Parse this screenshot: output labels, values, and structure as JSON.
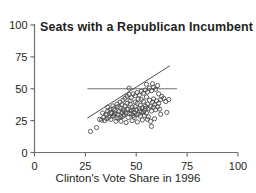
{
  "chart_data": {
    "type": "scatter",
    "title": "Seats with a Republican Incumbent",
    "xlabel": "Clinton's Vote Share in 1996",
    "ylabel": "",
    "xlim": [
      0,
      100
    ],
    "ylim": [
      0,
      100
    ],
    "xticks": [
      0,
      25,
      50,
      75,
      100
    ],
    "yticks": [
      0,
      25,
      50,
      75,
      100
    ],
    "xtick_labels": [
      "0",
      "25",
      "50",
      "75",
      "100"
    ],
    "ytick_labels": [
      "0",
      "25",
      "50",
      "75",
      "100"
    ],
    "grid": false,
    "legend": null,
    "marker": {
      "shape": "open-circle",
      "radius": 2.1,
      "color": "#4d4d4d",
      "fill": "none"
    },
    "annotations": [
      {
        "name": "fifty-percent-reference-line",
        "type": "hline",
        "y": 50,
        "x_start": 26,
        "x_end": 70,
        "color": "#6f6f6f"
      },
      {
        "name": "regression-line",
        "type": "line",
        "x_start": 26,
        "y_start": 27,
        "x_end": 66.5,
        "y_end": 68,
        "color": "#4d4d4d"
      }
    ],
    "points": [
      [
        27.5,
        16.5
      ],
      [
        30.5,
        19.5
      ],
      [
        33.0,
        25.5
      ],
      [
        34.5,
        25.0
      ],
      [
        35.5,
        26.5
      ],
      [
        36.5,
        27.5
      ],
      [
        37.5,
        26.0
      ],
      [
        38.5,
        28.5
      ],
      [
        33.5,
        31.0
      ],
      [
        35.0,
        30.0
      ],
      [
        36.0,
        32.5
      ],
      [
        37.0,
        33.5
      ],
      [
        38.0,
        30.5
      ],
      [
        39.0,
        29.0
      ],
      [
        39.5,
        33.0
      ],
      [
        40.0,
        24.5
      ],
      [
        40.5,
        27.0
      ],
      [
        41.0,
        30.0
      ],
      [
        41.5,
        32.0
      ],
      [
        42.0,
        35.0
      ],
      [
        42.5,
        28.0
      ],
      [
        43.0,
        31.5
      ],
      [
        43.5,
        33.5
      ],
      [
        44.0,
        29.5
      ],
      [
        44.5,
        36.5
      ],
      [
        45.0,
        31.0
      ],
      [
        45.5,
        34.0
      ],
      [
        46.0,
        27.5
      ],
      [
        46.5,
        30.5
      ],
      [
        47.0,
        38.0
      ],
      [
        47.5,
        33.0
      ],
      [
        48.0,
        35.5
      ],
      [
        48.5,
        29.0
      ],
      [
        49.0,
        31.5
      ],
      [
        49.5,
        36.0
      ],
      [
        50.0,
        33.5
      ],
      [
        50.5,
        38.5
      ],
      [
        51.0,
        30.0
      ],
      [
        51.5,
        34.5
      ],
      [
        52.0,
        37.0
      ],
      [
        52.5,
        32.0
      ],
      [
        53.0,
        35.0
      ],
      [
        53.5,
        40.0
      ],
      [
        54.0,
        33.0
      ],
      [
        54.5,
        36.5
      ],
      [
        55.0,
        31.0
      ],
      [
        55.5,
        38.0
      ],
      [
        56.0,
        34.5
      ],
      [
        56.5,
        41.0
      ],
      [
        57.0,
        36.0
      ],
      [
        57.5,
        32.5
      ],
      [
        58.0,
        39.5
      ],
      [
        58.5,
        35.5
      ],
      [
        59.0,
        37.5
      ],
      [
        59.5,
        33.5
      ],
      [
        60.0,
        40.5
      ],
      [
        60.5,
        36.0
      ],
      [
        61.0,
        38.5
      ],
      [
        61.5,
        34.0
      ],
      [
        62.0,
        41.5
      ],
      [
        36.0,
        35.5
      ],
      [
        38.5,
        36.5
      ],
      [
        40.5,
        38.0
      ],
      [
        42.0,
        39.5
      ],
      [
        43.5,
        41.0
      ],
      [
        44.5,
        42.5
      ],
      [
        45.5,
        44.0
      ],
      [
        46.5,
        45.5
      ],
      [
        47.5,
        43.0
      ],
      [
        48.5,
        46.0
      ],
      [
        49.5,
        44.5
      ],
      [
        50.5,
        47.0
      ],
      [
        51.5,
        45.0
      ],
      [
        52.5,
        48.0
      ],
      [
        53.5,
        46.5
      ],
      [
        54.5,
        49.0
      ],
      [
        55.5,
        47.5
      ],
      [
        56.5,
        50.5
      ],
      [
        57.5,
        48.5
      ],
      [
        58.5,
        51.0
      ],
      [
        59.5,
        49.5
      ],
      [
        60.5,
        52.5
      ],
      [
        46.5,
        50.5
      ],
      [
        55.0,
        53.5
      ],
      [
        58.0,
        54.0
      ],
      [
        61.0,
        46.0
      ],
      [
        62.5,
        44.0
      ],
      [
        63.5,
        42.5
      ],
      [
        64.5,
        40.0
      ],
      [
        66.0,
        41.5
      ],
      [
        65.0,
        31.5
      ],
      [
        62.0,
        30.0
      ],
      [
        59.0,
        26.5
      ],
      [
        57.0,
        24.5
      ],
      [
        55.5,
        26.0
      ],
      [
        53.0,
        25.5
      ],
      [
        50.5,
        24.0
      ],
      [
        48.0,
        25.0
      ],
      [
        45.0,
        23.5
      ],
      [
        42.5,
        24.5
      ],
      [
        57.5,
        20.5
      ],
      [
        49.0,
        27.5
      ],
      [
        52.0,
        28.5
      ],
      [
        54.0,
        29.0
      ],
      [
        56.0,
        28.0
      ],
      [
        39.0,
        34.5
      ],
      [
        41.0,
        36.0
      ],
      [
        43.0,
        37.5
      ],
      [
        47.0,
        40.5
      ],
      [
        51.0,
        42.0
      ],
      [
        44.0,
        32.5
      ],
      [
        46.0,
        34.0
      ],
      [
        48.5,
        33.5
      ],
      [
        50.0,
        29.5
      ],
      [
        53.5,
        31.5
      ],
      [
        45.5,
        38.5
      ],
      [
        49.5,
        39.5
      ],
      [
        52.5,
        41.5
      ],
      [
        55.0,
        43.5
      ],
      [
        58.5,
        42.0
      ],
      [
        41.5,
        27.0
      ],
      [
        43.5,
        28.5
      ],
      [
        47.5,
        30.5
      ],
      [
        51.5,
        32.5
      ],
      [
        54.5,
        34.5
      ],
      [
        37.5,
        31.5
      ],
      [
        39.5,
        30.5
      ],
      [
        34.0,
        27.5
      ],
      [
        35.5,
        29.5
      ],
      [
        32.0,
        26.0
      ]
    ]
  },
  "axis": {
    "x_tick_labels": [
      "0",
      "25",
      "50",
      "75",
      "100"
    ],
    "y_tick_labels": [
      "0",
      "25",
      "50",
      "75",
      "100"
    ],
    "xlabel": "Clinton's Vote Share in 1996",
    "title": "Seats with a Republican Incumbent"
  },
  "colors": {
    "axis": "#6f6f6f",
    "marker": "#4d4d4d",
    "text": "#231f20",
    "background": "#ffffff"
  }
}
